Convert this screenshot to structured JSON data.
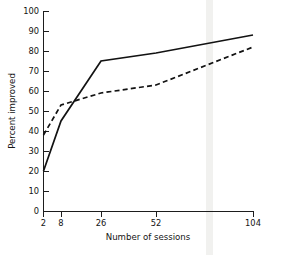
{
  "chart_data": {
    "type": "line",
    "title": "",
    "xlabel": "Number of sessions",
    "ylabel": "Percent improved",
    "x": [
      2,
      8,
      26,
      52,
      104
    ],
    "x_tick_labels": [
      "2",
      "8",
      "26",
      "52",
      "104"
    ],
    "y_tick_labels": [
      "0",
      "10",
      "20",
      "30",
      "40",
      "50",
      "60",
      "70",
      "80",
      "90",
      "100"
    ],
    "y_ticks": [
      0,
      10,
      20,
      30,
      40,
      50,
      60,
      70,
      80,
      90,
      100
    ],
    "ylim": [
      0,
      100
    ],
    "xlim": [
      2,
      104
    ],
    "x_scale": "ordinal-log-like",
    "grid": false,
    "legend": "none",
    "series": [
      {
        "name": "solid-series",
        "style": "solid",
        "color": "#121212",
        "values": [
          20,
          45,
          75,
          79,
          88
        ]
      },
      {
        "name": "dashed-series",
        "style": "dashed",
        "color": "#121212",
        "values": [
          38,
          53,
          59,
          63,
          82
        ]
      }
    ],
    "annotations": []
  },
  "axes": {
    "y_axis_title": "Percent improved",
    "x_axis_title": "Number of sessions"
  }
}
